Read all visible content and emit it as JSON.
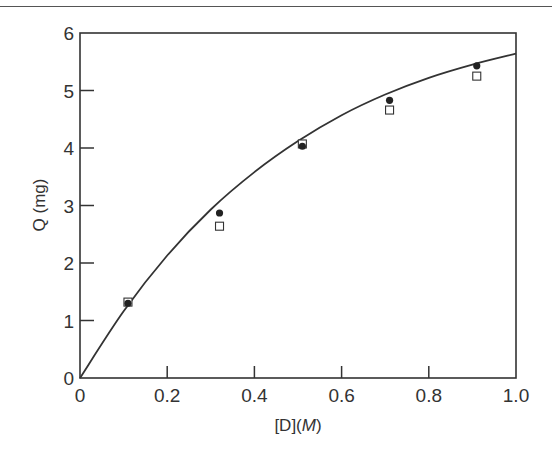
{
  "chart_data": {
    "type": "scatter",
    "title": "",
    "xlabel": "[D](M)",
    "xlabel_parts": {
      "prefix": "[D](",
      "italic": "M",
      "suffix": ")"
    },
    "ylabel": "Q (mg)",
    "xlim": [
      0,
      1.0
    ],
    "ylim": [
      0,
      6
    ],
    "x_ticks": [
      "0",
      "0.2",
      "0.4",
      "0.6",
      "0.8",
      "1.0"
    ],
    "x_tick_values": [
      0,
      0.2,
      0.4,
      0.6,
      0.8,
      1.0
    ],
    "y_ticks": [
      "0",
      "1",
      "2",
      "3",
      "4",
      "5",
      "6"
    ],
    "y_tick_values": [
      0,
      1,
      2,
      3,
      4,
      5,
      6
    ],
    "grid": false,
    "legend": null,
    "series": [
      {
        "name": "filled circles",
        "marker": "filled-circle",
        "x": [
          0.11,
          0.32,
          0.51,
          0.71,
          0.91
        ],
        "y": [
          1.3,
          2.87,
          4.03,
          4.83,
          5.43
        ]
      },
      {
        "name": "open squares",
        "marker": "open-square",
        "x": [
          0.11,
          0.32,
          0.51,
          0.71,
          0.91
        ],
        "y": [
          1.32,
          2.64,
          4.07,
          4.66,
          5.25
        ]
      },
      {
        "name": "fitted curve",
        "marker": "line",
        "x": [
          0,
          0.1,
          0.2,
          0.3,
          0.4,
          0.5,
          0.6,
          0.7,
          0.8,
          0.9,
          1.0
        ],
        "y": [
          0,
          1.16,
          2.13,
          2.93,
          3.58,
          4.12,
          4.57,
          4.93,
          5.22,
          5.45,
          5.64
        ]
      }
    ]
  },
  "colors": {
    "ink": "#333333",
    "background": "#ffffff"
  }
}
